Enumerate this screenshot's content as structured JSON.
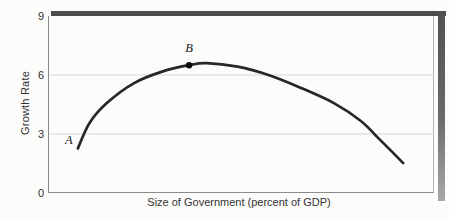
{
  "figure": {
    "background": "#fcfcfb"
  },
  "chart_data": {
    "type": "line",
    "title": "",
    "xlabel": "Size of Government (percent of GDP)",
    "ylabel": "Growth Rate",
    "ylim": [
      0,
      9
    ],
    "yticks": [
      0,
      3,
      6,
      9
    ],
    "xticks": [],
    "grid": "horizontal gridlines at y=3 and y=6",
    "legend": "none",
    "series": [
      {
        "name": "growth-rate-vs-size-of-government-curve",
        "x_fraction": [
          0.075,
          0.105,
          0.15,
          0.22,
          0.29,
          0.364,
          0.41,
          0.49,
          0.57,
          0.65,
          0.74,
          0.81,
          0.86,
          0.92
        ],
        "y": [
          2.27,
          3.55,
          4.57,
          5.58,
          6.15,
          6.5,
          6.6,
          6.42,
          6.0,
          5.38,
          4.57,
          3.66,
          2.7,
          1.52
        ]
      }
    ],
    "points": [
      {
        "label": "A",
        "x_fraction": 0.075,
        "y": 2.27,
        "marker": false,
        "label_dx": -9,
        "label_dy": -8
      },
      {
        "label": "B",
        "x_fraction": 0.364,
        "y": 6.5,
        "marker": true,
        "label_dx": 0,
        "label_dy": -17
      }
    ],
    "colors": {
      "curve": "#272727",
      "marker": "#0f0f0f",
      "grid": "#d6d6d6",
      "axis": "#8a8a8a",
      "shadow_dark": "#4d4d4d",
      "shadow_light": "#a8a8a8",
      "text": "#333333"
    }
  }
}
